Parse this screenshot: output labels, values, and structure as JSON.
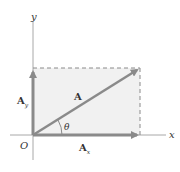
{
  "diagram": {
    "type": "vector-components",
    "labels": {
      "x_axis": "x",
      "y_axis": "y",
      "origin": "O",
      "vector": "A",
      "x_component_main": "A",
      "x_component_sub": "x",
      "y_component_main": "A",
      "y_component_sub": "y",
      "angle": "θ"
    },
    "colors": {
      "axis": "#9a9a9a",
      "vector": "#8a8a8a",
      "shade": "#f1f1f1",
      "dash": "#8a8a8a",
      "text": "#333333"
    }
  }
}
